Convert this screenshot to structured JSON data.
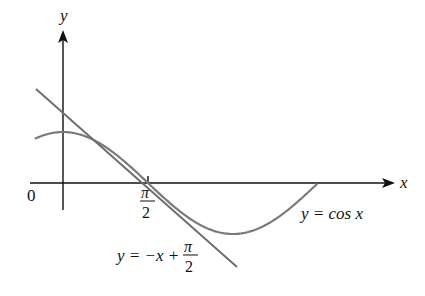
{
  "figure": {
    "axes": {
      "x_label": "x",
      "y_label": "y",
      "origin_label": "0"
    },
    "tick_pi2": {
      "num": "π",
      "den": "2"
    },
    "curve_label": "y = cos x",
    "tangent_label": {
      "prefix": "y = −x + ",
      "num": "π",
      "den": "2"
    },
    "colors": {
      "axis": "#111111",
      "curve": "#7a7a7a",
      "tangent": "#6e6e6e"
    }
  }
}
